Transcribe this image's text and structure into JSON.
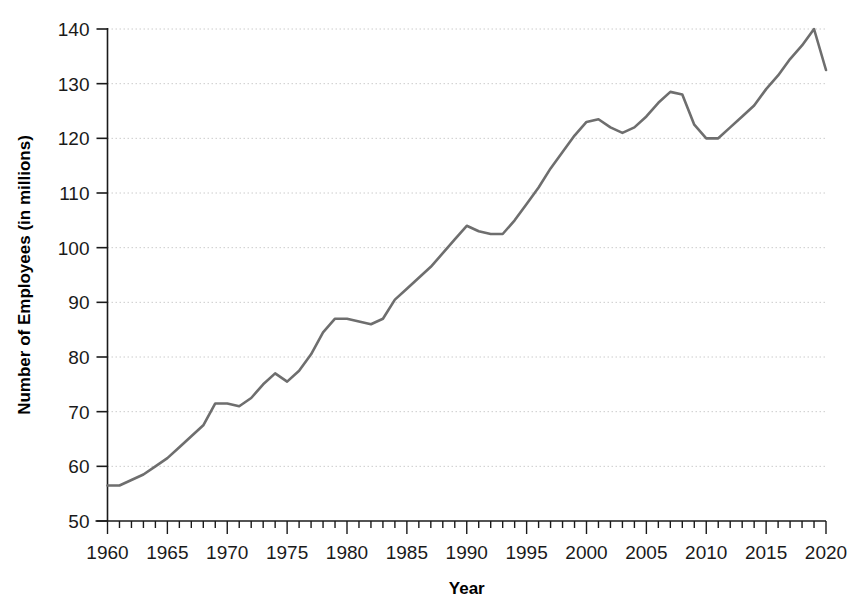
{
  "chart_data": {
    "type": "line",
    "title": "",
    "xlabel": "Year",
    "ylabel": "Number of Employees (in millions)",
    "xlim": [
      1960,
      2020
    ],
    "ylim": [
      50,
      140
    ],
    "grid": true,
    "legend": false,
    "line_color": "#6e6e6e",
    "gridline_color": "#cccccc",
    "axis_color": "#1a1a1a",
    "background_color": "#ffffff",
    "y_ticks": [
      50,
      60,
      70,
      80,
      90,
      100,
      110,
      120,
      130,
      140
    ],
    "y_tick_labels": [
      "50",
      "60",
      "70",
      "80",
      "90",
      "100",
      "110",
      "120",
      "130",
      "140"
    ],
    "x_ticks": [
      1960,
      1965,
      1970,
      1975,
      1980,
      1985,
      1990,
      1995,
      2000,
      2005,
      2010,
      2015,
      2020
    ],
    "x_tick_labels": [
      "1960",
      "1965",
      "1970",
      "1975",
      "1980",
      "1985",
      "1990",
      "1995",
      "2000",
      "2005",
      "2010",
      "2015",
      "2020"
    ],
    "x_minor_tick_step": 1,
    "series": [
      {
        "name": "Number of Employees",
        "x": [
          1960,
          1961,
          1962,
          1963,
          1964,
          1965,
          1966,
          1967,
          1968,
          1969,
          1970,
          1971,
          1972,
          1973,
          1974,
          1975,
          1976,
          1977,
          1978,
          1979,
          1980,
          1981,
          1982,
          1983,
          1984,
          1985,
          1986,
          1987,
          1988,
          1989,
          1990,
          1991,
          1992,
          1993,
          1994,
          1995,
          1996,
          1997,
          1998,
          1999,
          2000,
          2001,
          2002,
          2003,
          2004,
          2005,
          2006,
          2007,
          2008,
          2009,
          2010,
          2011,
          2012,
          2013,
          2014,
          2015,
          2016,
          2017,
          2018,
          2019,
          2020
        ],
        "y": [
          56.5,
          56.5,
          57.5,
          58.5,
          60.0,
          61.5,
          63.5,
          65.5,
          67.5,
          71.5,
          71.5,
          71.0,
          72.5,
          75.0,
          77.0,
          75.5,
          77.5,
          80.5,
          84.5,
          87.0,
          87.0,
          86.5,
          86.0,
          87.0,
          90.5,
          92.5,
          94.5,
          96.5,
          99.0,
          101.5,
          104.0,
          103.0,
          102.5,
          102.5,
          105.0,
          108.0,
          111.0,
          114.5,
          117.5,
          120.5,
          123.0,
          123.5,
          122.0,
          121.0,
          122.0,
          124.0,
          126.5,
          128.5,
          128.0,
          122.5,
          120.0,
          120.0,
          122.0,
          124.0,
          126.0,
          129.0,
          131.5,
          134.5,
          137.0,
          140.0,
          132.5
        ]
      }
    ]
  }
}
